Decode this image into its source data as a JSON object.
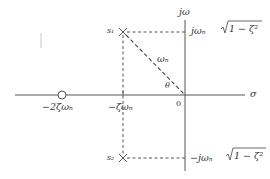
{
  "diagram": {
    "type": "s-plane pole-zero plot",
    "axes": {
      "vertical_label": "jω",
      "horizontal_label": "σ",
      "origin_label": "0"
    },
    "poles": [
      {
        "id": "s1",
        "label": "s₁",
        "marker": "cross"
      },
      {
        "id": "s2",
        "label": "s₂",
        "marker": "cross"
      }
    ],
    "zeros": [
      {
        "marker": "open-circle",
        "label": "−2ζωₙ"
      }
    ],
    "labels": {
      "upper_imag": "jωₙ√(1 − ζ²)",
      "upper_imag_prefix": "jωₙ",
      "upper_imag_radicand": "1 − ζ²",
      "lower_imag_prefix": "−jωₙ",
      "lower_imag_radicand": "1 − ζ²",
      "real_part": "−ζωₙ",
      "zero_location": "−2ζωₙ",
      "radius": "ωₙ",
      "angle": "θ"
    },
    "colors": {
      "line": "#555555",
      "text": "#333333",
      "background": "#ffffff"
    }
  }
}
